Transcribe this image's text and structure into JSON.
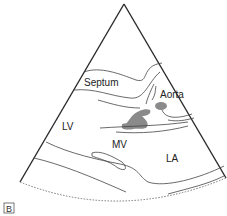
{
  "diagram": {
    "type": "echocardiogram-parasternal-long-axis-schematic",
    "panel_label": "B",
    "labels": {
      "septum": "Septum",
      "aorta": "Aorta",
      "lv": "LV",
      "mv": "MV",
      "la": "LA"
    },
    "colors": {
      "outline": "#2a2a2a",
      "structure_line": "#444444",
      "valve_fill": "#8a8a8a",
      "arc_dotted": "#777777"
    }
  }
}
